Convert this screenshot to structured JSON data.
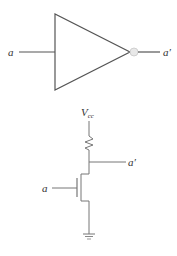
{
  "diagram": {
    "type": "inverter",
    "colors": {
      "stroke": "#555555",
      "text": "#333333",
      "bubble_fill": "#e8e8e8",
      "bubble_stroke": "#c8c8c8",
      "background": "#ffffff"
    },
    "gate_symbol": {
      "name": "NOT gate",
      "input_label": "a",
      "output_label": "a′"
    },
    "transistor_circuit": {
      "supply_label": "V",
      "supply_subscript": "cc",
      "input_label": "a",
      "output_label": "a′",
      "components": [
        "pull-up resistor",
        "n-channel MOSFET",
        "ground"
      ]
    }
  }
}
